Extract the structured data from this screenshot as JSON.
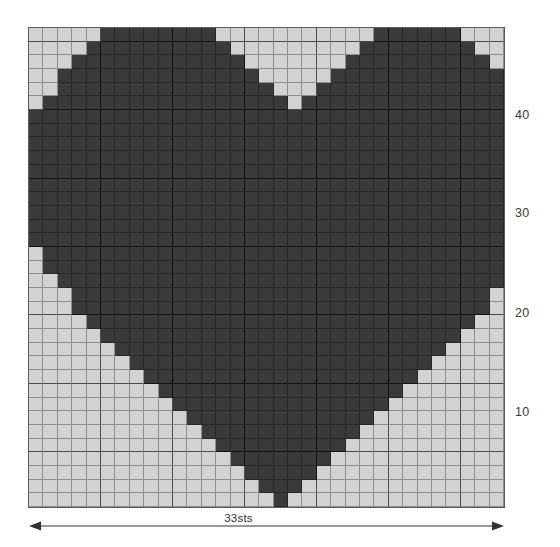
{
  "chart_data": {
    "type": "heatmap",
    "title": "",
    "subtitle": "",
    "xlabel": "33sts",
    "ylabel": "",
    "grid": true,
    "legend_position": "none",
    "columns": 33,
    "rows": 33,
    "colors": {
      "filled": "#3a3a3c",
      "empty": "#d2d2d1",
      "gridline": "#8d8d8d",
      "gridline_major": "#4a4a4a",
      "background": "#ffffff",
      "text": "#3a3a3a"
    },
    "major_gridline_every": 5,
    "x_tick_labels": [],
    "y_tick_labels": [
      "10",
      "20",
      "30",
      "40"
    ],
    "annotations": [
      {
        "name": "width-measure",
        "text": "33sts",
        "position": "bottom",
        "style": "double-arrow"
      }
    ],
    "pattern_rows_top_to_bottom": [
      "00000111111110000000000011111100000",
      "00001111111111000000000111111110000",
      "00011111111111100000001111111111000",
      "00111111111111110000011111111111100",
      "00111111111111111000111111111111100",
      "01111111111111111101111111111111110",
      "11111111111111111111111111111111111",
      "11111111111111111111111111111111111",
      "11111111111111111111111111111111111",
      "11111111111111111111111111111111111",
      "11111111111111111111111111111111111",
      "11111111111111111111111111111111111",
      "11111111111111111111111111111111111",
      "11111111111111111111111111111111111",
      "11111111111111111111111111111111111",
      "11111111111111111111111111111111111",
      "01111111111111111111111111111111110",
      "01111111111111111111111111111111110",
      "00111111111111111111111111111111100",
      "00011111111111111111111111111111000",
      "00011111111111111111111111111111000",
      "00001111111111111111111111111110000",
      "00000111111111111111111111111100000",
      "00000011111111111111111111111000000",
      "00000001111111111111111111110000000",
      "00000000111111111111111111100000000",
      "00000000011111111111111111000000000",
      "00000000001111111111111110000000000",
      "00000000000111111111111100000000000",
      "00000000000011111111111000000000000",
      "00000000000001111111110000000000000",
      "00000000000000111111100000000000000",
      "00000000000000011111000000000000000",
      "00000000000000001110000000000000000",
      "00000000000000000100000000000000000"
    ]
  },
  "row_labels": [
    {
      "text": "40",
      "top": 109
    },
    {
      "text": "30",
      "top": 207
    },
    {
      "text": "20",
      "top": 307
    },
    {
      "text": "10",
      "top": 406
    }
  ],
  "width_annotation": {
    "label": "33sts"
  }
}
